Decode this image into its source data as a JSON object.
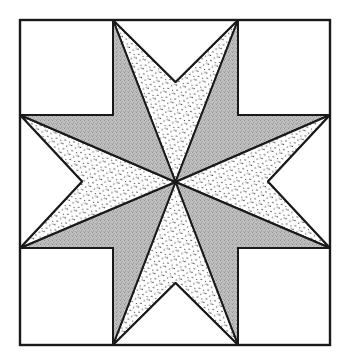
{
  "figure": {
    "canvas": {
      "width": 346,
      "height": 363,
      "background": "#ffffff"
    }
  },
  "style": {
    "line_color": "#1a1a1a",
    "border_stroke_width": 2.4,
    "inner_stroke_width": 2.0,
    "fill_white": "#ffffff",
    "fill_gray": "#b9b9b9",
    "fill_dotted_base": "#ffffff",
    "dot_color": "#1a1a1a",
    "gray_noise_color": "#8d8d8d"
  },
  "geometry": {
    "border": {
      "left": 20,
      "top": 20,
      "right": 330,
      "bottom": 345
    },
    "grid_x": [
      20,
      113,
      238,
      330
    ],
    "grid_y": [
      20,
      115,
      248,
      345
    ],
    "center": {
      "x": 175.5,
      "y": 182.0
    },
    "note": "Eight diamonds meet at the centre; diamond tips land on the grid intersections and on the border at x=113, x=238, y=115, y=248."
  },
  "pieces": {
    "corner_squares": [
      {
        "name": "corner-square-top-left",
        "fill": "white",
        "points": "20,20 113,20 113,115 20,115"
      },
      {
        "name": "corner-square-top-right",
        "fill": "white",
        "points": "238,20 330,20 330,115 238,115"
      },
      {
        "name": "corner-square-bottom-left",
        "fill": "white",
        "points": "20,248 113,248 113,345 20,345"
      },
      {
        "name": "corner-square-bottom-right",
        "fill": "white",
        "points": "238,248 330,248 330,345 238,345"
      }
    ],
    "edge_triangles": [
      {
        "name": "edge-triangle-top",
        "fill": "white",
        "points": "113,20 238,20 175.5,82"
      },
      {
        "name": "edge-triangle-bottom",
        "fill": "white",
        "points": "113,345 238,345 175.5,283"
      },
      {
        "name": "edge-triangle-left",
        "fill": "white",
        "points": "20,115 20,248 82,181.5"
      },
      {
        "name": "edge-triangle-right",
        "fill": "white",
        "points": "330,115 330,248 268,181.5"
      }
    ],
    "star_diamonds": [
      {
        "name": "star-diamond-n",
        "index": 0,
        "fill": "dotted",
        "points": "175.5,182 113,20 175.5,82 238,20"
      },
      {
        "name": "star-diamond-ne",
        "index": 1,
        "fill": "gray",
        "points": "175.5,182 238,20 238,115 330,115"
      },
      {
        "name": "star-diamond-e",
        "index": 2,
        "fill": "dotted",
        "points": "175.5,182 330,115 268,181.5 330,248"
      },
      {
        "name": "star-diamond-se",
        "index": 3,
        "fill": "gray",
        "points": "175.5,182 330,248 238,248 238,345"
      },
      {
        "name": "star-diamond-s",
        "index": 4,
        "fill": "dotted",
        "points": "175.5,182 238,345 175.5,283 113,345"
      },
      {
        "name": "star-diamond-sw",
        "index": 5,
        "fill": "gray",
        "points": "175.5,182 113,345 113,248 20,248"
      },
      {
        "name": "star-diamond-w",
        "index": 6,
        "fill": "dotted",
        "points": "175.5,182 20,248 82,181.5 20,115"
      },
      {
        "name": "star-diamond-nw",
        "index": 7,
        "fill": "gray",
        "points": "175.5,182 20,115 113,115 113,20"
      }
    ],
    "grid_lines": [
      {
        "name": "grid-line-h-upper",
        "x1": 20,
        "y1": 115,
        "x2": 330,
        "y2": 115
      },
      {
        "name": "grid-line-h-lower",
        "x1": 20,
        "y1": 248,
        "x2": 330,
        "y2": 248
      },
      {
        "name": "grid-line-v-left",
        "x1": 113,
        "y1": 20,
        "x2": 113,
        "y2": 345
      },
      {
        "name": "grid-line-v-right",
        "x1": 238,
        "y1": 20,
        "x2": 238,
        "y2": 345
      }
    ]
  }
}
